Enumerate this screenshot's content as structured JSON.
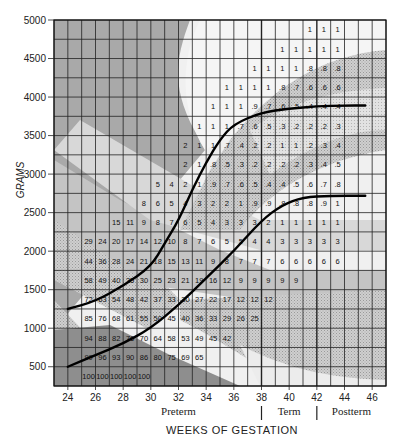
{
  "chart_data": {
    "type": "heatmap",
    "title": "",
    "xlabel": "WEEKS OF GESTATION",
    "ylabel": "GRAMS",
    "x_range": [
      23,
      47
    ],
    "y_range": [
      250,
      5000
    ],
    "x_ticks": [
      24,
      26,
      28,
      30,
      32,
      34,
      36,
      38,
      40,
      42,
      44,
      46
    ],
    "y_ticks": [
      500,
      1000,
      1500,
      2000,
      2500,
      3000,
      3500,
      4000,
      4500,
      5000
    ],
    "cell_width_weeks": 1,
    "cell_height_grams": 250,
    "period_labels": [
      {
        "label": "Preterm",
        "center_week": 32
      },
      {
        "label": "Term",
        "center_week": 40
      },
      {
        "label": "Postterm",
        "center_week": 44.5
      }
    ],
    "period_dividers_weeks": [
      38,
      42
    ],
    "grid": true,
    "rows": [
      {
        "grams_low": 4750,
        "start_week": 41,
        "values": [
          "1",
          "1",
          "1"
        ]
      },
      {
        "grams_low": 4500,
        "start_week": 39,
        "values": [
          "1",
          "1",
          "1",
          "1",
          "1"
        ]
      },
      {
        "grams_low": 4250,
        "start_week": 37,
        "values": [
          "1",
          "1",
          "1",
          "1",
          ".8",
          ".8",
          ".8"
        ]
      },
      {
        "grams_low": 4000,
        "start_week": 35,
        "values": [
          "1",
          "1",
          "1",
          "1",
          ".8",
          ".7",
          ".6",
          ".6",
          ".6"
        ]
      },
      {
        "grams_low": 3750,
        "start_week": 34,
        "values": [
          "1",
          "1",
          "1",
          ".9",
          ".7",
          ".6",
          ".5",
          ".4",
          ".4",
          ".4"
        ]
      },
      {
        "grams_low": 3500,
        "start_week": 33,
        "values": [
          "1",
          "1",
          "1",
          ".7",
          ".6",
          ".5",
          ".3",
          ".2",
          ".2",
          ".2",
          ".3"
        ]
      },
      {
        "grams_low": 3250,
        "start_week": 32,
        "values": [
          "2",
          "1",
          "1",
          ".7",
          ".4",
          ".2",
          ".2",
          "1",
          "1",
          ".2",
          ".3",
          ".4"
        ]
      },
      {
        "grams_low": 3000,
        "start_week": 32,
        "values": [
          "2",
          "1",
          ".8",
          ".5",
          ".3",
          ".2",
          ".2",
          ".2",
          ".2",
          ".3",
          ".4",
          ".5"
        ]
      },
      {
        "grams_low": 2750,
        "start_week": 30,
        "values": [
          "5",
          "4",
          "2",
          "1",
          ".9",
          ".7",
          ".6",
          ".5",
          ".4",
          ".4",
          ".5",
          ".6",
          ".7",
          ".8"
        ]
      },
      {
        "grams_low": 2500,
        "start_week": 29,
        "values": [
          "8",
          "6",
          "5",
          "4",
          "3",
          "2",
          "2",
          "1",
          ".9",
          ".9",
          ".8",
          ".8",
          ".8",
          ".9",
          "1"
        ]
      },
      {
        "grams_low": 2250,
        "start_week": 27,
        "values": [
          "15",
          "11",
          "9",
          "8",
          "7",
          "6",
          "5",
          "4",
          "3",
          "3",
          "3",
          "2",
          "1",
          "1",
          "1",
          "1",
          "1"
        ]
      },
      {
        "grams_low": 2000,
        "start_week": 25,
        "values": [
          "29",
          "24",
          "20",
          "17",
          "14",
          "12",
          "10",
          "8",
          "7",
          "6",
          "5",
          "5",
          "4",
          "4",
          "3",
          "3",
          "3",
          "3",
          "3"
        ]
      },
      {
        "grams_low": 1750,
        "start_week": 25,
        "values": [
          "44",
          "36",
          "28",
          "24",
          "21",
          "18",
          "15",
          "13",
          "11",
          "9",
          "8",
          "7",
          "7",
          "7",
          "6",
          "6",
          "6",
          "6",
          "6"
        ]
      },
      {
        "grams_low": 1500,
        "start_week": 25,
        "values": [
          "58",
          "49",
          "40",
          "35",
          "30",
          "25",
          "23",
          "21",
          "19",
          "16",
          "12",
          "9",
          "9",
          "9",
          "9",
          "9"
        ]
      },
      {
        "grams_low": 1250,
        "start_week": 25,
        "values": [
          "72",
          "63",
          "54",
          "48",
          "42",
          "37",
          "33",
          "30",
          "27",
          "22",
          "17",
          "12",
          "12",
          "12"
        ]
      },
      {
        "grams_low": 1000,
        "start_week": 25,
        "values": [
          "85",
          "76",
          "68",
          "61",
          "55",
          "50",
          "45",
          "40",
          "36",
          "33",
          "29",
          "26",
          "25"
        ]
      },
      {
        "grams_low": 750,
        "start_week": 25,
        "values": [
          "94",
          "88",
          "82",
          "76",
          "70",
          "64",
          "58",
          "53",
          "49",
          "45",
          "42"
        ]
      },
      {
        "grams_low": 500,
        "start_week": 25,
        "values": [
          "99",
          "96",
          "93",
          "90",
          "86",
          "80",
          "75",
          "69",
          "65"
        ]
      },
      {
        "grams_low": 250,
        "start_week": 25,
        "values": [
          "100",
          "100",
          "100",
          "100",
          "100"
        ]
      }
    ],
    "series": [
      {
        "name": "upper-percentile-curve",
        "type": "line",
        "points": [
          [
            24,
            1250
          ],
          [
            26,
            1350
          ],
          [
            28,
            1550
          ],
          [
            30,
            1800
          ],
          [
            31,
            2100
          ],
          [
            32,
            2400
          ],
          [
            33,
            2800
          ],
          [
            34,
            3150
          ],
          [
            35,
            3450
          ],
          [
            36,
            3650
          ],
          [
            38,
            3800
          ],
          [
            40,
            3850
          ],
          [
            42,
            3880
          ],
          [
            44,
            3890
          ],
          [
            45.5,
            3890
          ]
        ]
      },
      {
        "name": "lower-percentile-curve",
        "type": "line",
        "points": [
          [
            24,
            500
          ],
          [
            26,
            650
          ],
          [
            28,
            800
          ],
          [
            30,
            1000
          ],
          [
            32,
            1300
          ],
          [
            34,
            1650
          ],
          [
            36,
            2000
          ],
          [
            38,
            2400
          ],
          [
            39.5,
            2600
          ],
          [
            41,
            2700
          ],
          [
            43,
            2720
          ],
          [
            45.5,
            2720
          ]
        ]
      }
    ]
  }
}
